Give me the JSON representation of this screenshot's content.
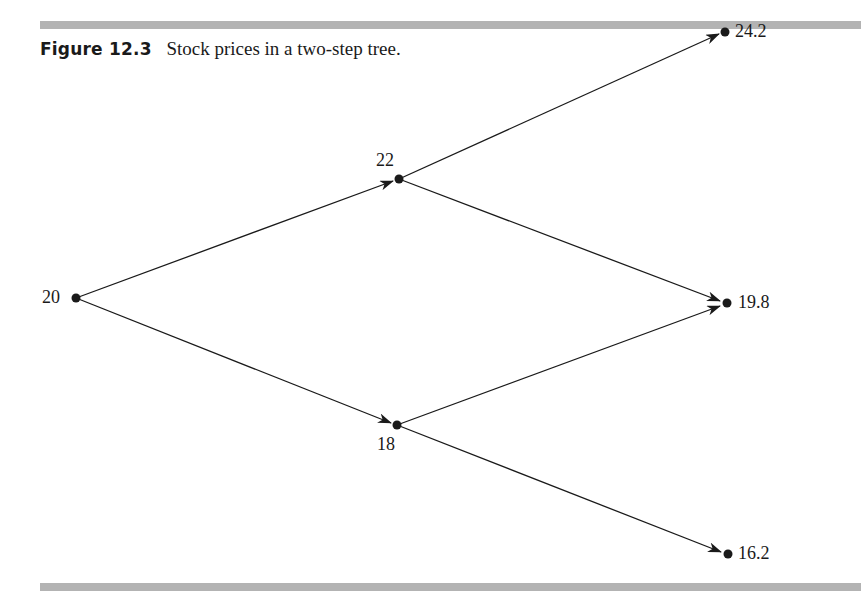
{
  "figure": {
    "number": "Figure 12.3",
    "title": "Stock prices in a two-step tree."
  },
  "tree": {
    "type": "binomial-tree",
    "steps": 2,
    "nodes": [
      {
        "id": "n0",
        "label": "20",
        "step": 0
      },
      {
        "id": "u",
        "label": "22",
        "step": 1
      },
      {
        "id": "d",
        "label": "18",
        "step": 1
      },
      {
        "id": "uu",
        "label": "24.2",
        "step": 2
      },
      {
        "id": "ud",
        "label": "19.8",
        "step": 2
      },
      {
        "id": "dd",
        "label": "16.2",
        "step": 2
      }
    ],
    "edges": [
      {
        "from": "n0",
        "to": "u"
      },
      {
        "from": "n0",
        "to": "d"
      },
      {
        "from": "u",
        "to": "uu"
      },
      {
        "from": "u",
        "to": "ud"
      },
      {
        "from": "d",
        "to": "ud"
      },
      {
        "from": "d",
        "to": "dd"
      }
    ]
  },
  "colors": {
    "rule": "#b3b3b3",
    "ink": "#1a1a1a"
  }
}
